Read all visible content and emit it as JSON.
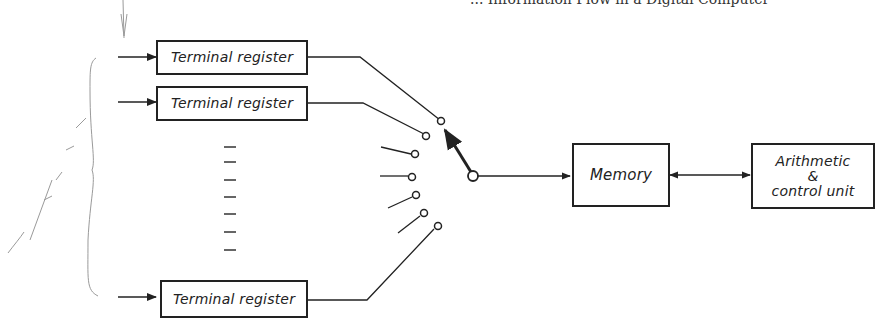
{
  "header": {
    "text": "... Information Flow in a Digital Computer"
  },
  "diagram": {
    "terminal_registers": [
      {
        "label": "Terminal register"
      },
      {
        "label": "Terminal register"
      },
      {
        "label": "Terminal register"
      }
    ],
    "memory": {
      "label": "Memory"
    },
    "arithmetic_unit": {
      "line1": "Arithmetic",
      "line2": "&",
      "line3": "control unit"
    },
    "switch": {
      "contact_count": 8,
      "selected_contact": 1
    },
    "ellipsis_dashes": 7,
    "annotations": {
      "handwritten_note": "info – abc"
    },
    "colors": {
      "ink": "#222222",
      "pencil": "#9a9a9a",
      "background": "#ffffff"
    }
  }
}
